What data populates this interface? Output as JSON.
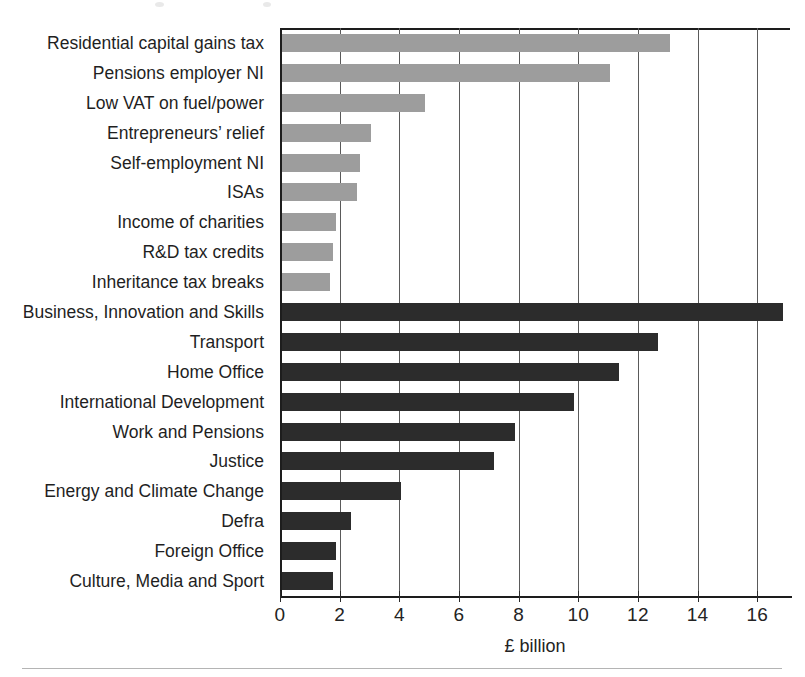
{
  "chart_data": {
    "type": "bar",
    "orientation": "horizontal",
    "title": "",
    "xlabel": "£ billion",
    "ylabel": "",
    "xlim": [
      0,
      17.1
    ],
    "xticks": [
      0,
      2,
      4,
      6,
      8,
      10,
      12,
      14,
      16
    ],
    "xtick_labels": [
      "0",
      "2",
      "4",
      "6",
      "8",
      "10",
      "12",
      "14",
      "16"
    ],
    "grid": true,
    "grid_axis": "x",
    "legend": "none",
    "categories": [
      "Residential capital gains tax",
      "Pensions employer NI",
      "Low VAT on fuel/power",
      "Entrepreneurs’ relief",
      "Self-employment NI",
      "ISAs",
      "Income of charities",
      "R&D tax credits",
      "Inheritance tax breaks",
      "Business, Innovation and Skills",
      "Transport",
      "Home Office",
      "International Development",
      "Work and Pensions",
      "Justice",
      "Energy and Climate Change",
      "Defra",
      "Foreign Office",
      "Culture, Media and Sport"
    ],
    "values": [
      13.0,
      11.0,
      4.8,
      3.0,
      2.6,
      2.5,
      1.8,
      1.7,
      1.6,
      16.8,
      12.6,
      11.3,
      9.8,
      7.8,
      7.1,
      4.0,
      2.3,
      1.8,
      1.7
    ],
    "groups": [
      "tax",
      "tax",
      "tax",
      "tax",
      "tax",
      "tax",
      "tax",
      "tax",
      "tax",
      "dept",
      "dept",
      "dept",
      "dept",
      "dept",
      "dept",
      "dept",
      "dept",
      "dept",
      "dept"
    ],
    "group_colors": {
      "tax": "#9d9d9d",
      "dept": "#2c2c2c"
    }
  },
  "axis": {
    "x_axis_label": "£ billion",
    "tick_labels": [
      "0",
      "2",
      "4",
      "6",
      "8",
      "10",
      "12",
      "14",
      "16"
    ]
  },
  "colors": {
    "tax_bar": "#9d9d9d",
    "department_bar": "#2c2c2c",
    "axis": "#1d1d1d",
    "grid": "#5a5a5a",
    "text": "#1f1f1f",
    "background": "#ffffff",
    "footer_rule": "#b4b4b4"
  }
}
